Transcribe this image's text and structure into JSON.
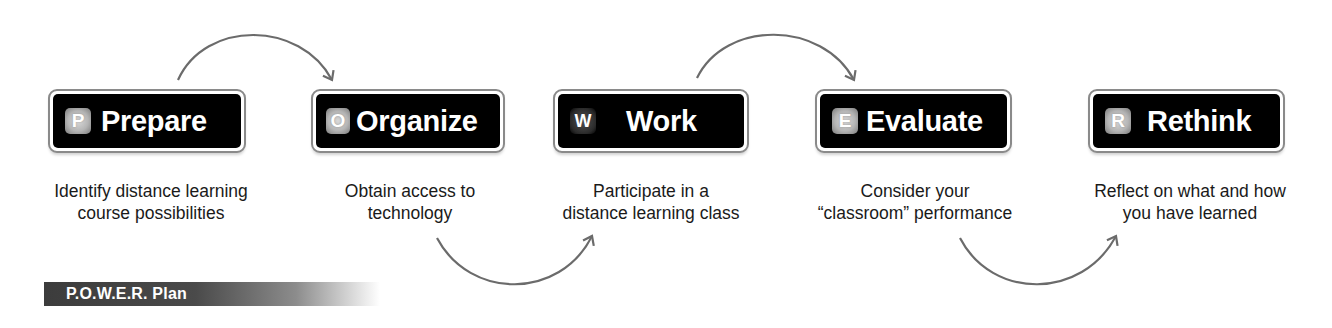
{
  "steps": [
    {
      "letter": "P",
      "label": "Prepare",
      "description": "Identify distance learning\ncourse possibilities"
    },
    {
      "letter": "O",
      "label": "Organize",
      "description": "Obtain access to\ntechnology"
    },
    {
      "letter": "W",
      "label": "Work",
      "description": "Participate in a\ndistance learning class"
    },
    {
      "letter": "E",
      "label": "Evaluate",
      "description": "Consider your\n“classroom” performance"
    },
    {
      "letter": "R",
      "label": "Rethink",
      "description": "Reflect on what and how\nyou have learned"
    }
  ],
  "banner": {
    "title": "P.O.W.E.R. Plan"
  },
  "colors": {
    "box_fill": "#000000",
    "box_border": "#8a8a8a",
    "arrow": "#6b6b6b",
    "text": "#1a1a1a"
  }
}
